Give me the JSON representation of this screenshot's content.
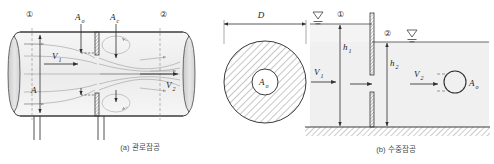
{
  "figure": {
    "title_a": "(a) 관로잠공",
    "title_b": "(b) 수중잠공",
    "colors": {
      "line": "#3c3c3c",
      "fill": "#f2f2f2",
      "streamline": "#9a9a9a",
      "hatch": "#707070",
      "caption": "#4a4a4a"
    }
  },
  "panel_a": {
    "name": "pipe-orifice-diagram",
    "section_1": "①",
    "section_2": "②",
    "label_area_orifice": "A",
    "label_area_orifice_sub": "o",
    "label_area_contracta": "A",
    "label_area_contracta_sub": "c",
    "label_area_pipe": "A",
    "label_velocity_1": "V",
    "label_velocity_1_sub": "1",
    "label_velocity_2": "V",
    "label_velocity_2_sub": "2"
  },
  "panel_cross_section": {
    "name": "pipe-cross-section",
    "label_diameter": "D",
    "label_area_orifice": "A",
    "label_area_orifice_sub": "o"
  },
  "panel_b": {
    "name": "submerged-orifice-diagram",
    "section_1": "①",
    "section_2": "②",
    "label_head_1": "h",
    "label_head_1_sub": "1",
    "label_head_2": "h",
    "label_head_2_sub": "2",
    "label_velocity_1": "V",
    "label_velocity_1_sub": "1",
    "label_velocity_2": "V",
    "label_velocity_2_sub": "2",
    "label_area_orifice": "A",
    "label_area_orifice_sub": "o"
  }
}
